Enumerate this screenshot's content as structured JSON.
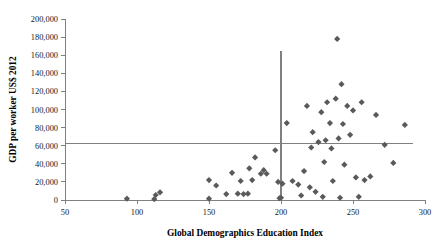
{
  "chart_data": {
    "type": "scatter",
    "title": "",
    "xlabel": "Global Demographics Education Index",
    "ylabel": "GDP per worker US$ 2012",
    "xlim": [
      50,
      300
    ],
    "ylim": [
      0,
      200000
    ],
    "xticks": [
      50,
      100,
      150,
      200,
      250,
      300
    ],
    "xtick_labels": [
      "50",
      "100",
      "150",
      "200",
      "250",
      "300"
    ],
    "yticks": [
      0,
      20000,
      40000,
      60000,
      80000,
      100000,
      120000,
      140000,
      160000,
      180000,
      200000
    ],
    "ytick_labels": [
      "0",
      "20,000",
      "40,000",
      "60,000",
      "80,000",
      "100,000",
      "120,000",
      "140,000",
      "160,000",
      "180,000",
      "200,000"
    ],
    "grid": false,
    "legend": false,
    "marker_shape": "diamond",
    "marker_color": "#5a5a5a",
    "reference_lines": [
      {
        "orientation": "horizontal",
        "value": 62000,
        "color": "#808080"
      },
      {
        "orientation": "vertical",
        "value": 200,
        "color": "#808080"
      }
    ],
    "points": [
      [
        93,
        1500
      ],
      [
        112,
        1000
      ],
      [
        113,
        5500
      ],
      [
        116,
        8500
      ],
      [
        150,
        1500
      ],
      [
        150,
        22000
      ],
      [
        155,
        16000
      ],
      [
        162,
        6500
      ],
      [
        166,
        30000
      ],
      [
        170,
        7000
      ],
      [
        172,
        21000
      ],
      [
        174,
        6500
      ],
      [
        177,
        7000
      ],
      [
        178,
        35000
      ],
      [
        180,
        22000
      ],
      [
        182,
        47000
      ],
      [
        186,
        29000
      ],
      [
        188,
        33000
      ],
      [
        190,
        29000
      ],
      [
        196,
        55000
      ],
      [
        198,
        20000
      ],
      [
        199,
        2000
      ],
      [
        200,
        2500
      ],
      [
        201,
        18000
      ],
      [
        204,
        85000
      ],
      [
        208,
        21000
      ],
      [
        212,
        17000
      ],
      [
        214,
        5000
      ],
      [
        216,
        32000
      ],
      [
        218,
        104000
      ],
      [
        220,
        14000
      ],
      [
        221,
        58000
      ],
      [
        222,
        75000
      ],
      [
        224,
        9000
      ],
      [
        226,
        64000
      ],
      [
        228,
        97000
      ],
      [
        229,
        3500
      ],
      [
        230,
        42000
      ],
      [
        231,
        66000
      ],
      [
        232,
        108000
      ],
      [
        234,
        85000
      ],
      [
        235,
        57000
      ],
      [
        236,
        21000
      ],
      [
        238,
        112000
      ],
      [
        239,
        178000
      ],
      [
        240,
        68000
      ],
      [
        241,
        2500
      ],
      [
        242,
        128000
      ],
      [
        243,
        84000
      ],
      [
        244,
        39000
      ],
      [
        246,
        104000
      ],
      [
        248,
        72000
      ],
      [
        250,
        99000
      ],
      [
        252,
        25000
      ],
      [
        254,
        3500
      ],
      [
        256,
        108000
      ],
      [
        258,
        22000
      ],
      [
        262,
        26000
      ],
      [
        266,
        94000
      ],
      [
        272,
        61000
      ],
      [
        278,
        41000
      ],
      [
        286,
        83000
      ]
    ]
  }
}
